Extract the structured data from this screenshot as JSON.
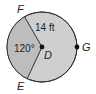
{
  "diagram": {
    "type": "circle-sector",
    "center": {
      "label": "D",
      "x": 42,
      "y": 47
    },
    "radius_px": 35,
    "points": [
      {
        "label": "F",
        "x": 22,
        "y": 12
      },
      {
        "label": "E",
        "x": 27,
        "y": 80
      },
      {
        "label": "G",
        "x": 78,
        "y": 47
      }
    ],
    "labels": {
      "radius": "14 ft",
      "angle": "120°",
      "F": "F",
      "E": "E",
      "G": "G",
      "D": "D"
    },
    "colors": {
      "sector_fill": "#b9b9b9",
      "circle_fill": "#cfcfcf",
      "stroke": "#333333",
      "background": "#ffffff"
    }
  }
}
